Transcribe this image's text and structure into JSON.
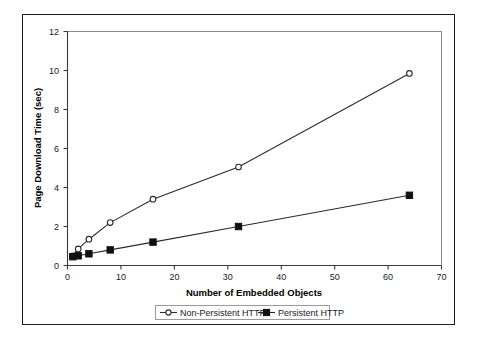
{
  "chart_data": {
    "type": "line",
    "title": "",
    "xlabel": "Number of Embedded Objects",
    "ylabel": "Page Download Time (sec)",
    "xlim": [
      0,
      70
    ],
    "ylim": [
      0,
      12
    ],
    "xticks": [
      0,
      10,
      20,
      30,
      40,
      50,
      60,
      70
    ],
    "yticks": [
      0,
      2,
      4,
      6,
      8,
      10,
      12
    ],
    "xtick_labels": [
      "0",
      "10",
      "20",
      "30",
      "40",
      "50",
      "60",
      "70"
    ],
    "ytick_labels": [
      "0",
      "2",
      "4",
      "6",
      "8",
      "10",
      "12"
    ],
    "grid": false,
    "legend_position": "bottom",
    "x": [
      1,
      2,
      4,
      8,
      16,
      32,
      64
    ],
    "series": [
      {
        "name": "Non-Persistent HTTP",
        "marker": "open-circle",
        "color": "#2b2b2b",
        "values": [
          0.5,
          0.85,
          1.35,
          2.2,
          3.4,
          5.05,
          9.85
        ]
      },
      {
        "name": "Persistent HTTP",
        "marker": "filled-square",
        "color": "#111111",
        "values": [
          0.45,
          0.5,
          0.6,
          0.8,
          1.2,
          2.0,
          3.6
        ]
      }
    ]
  },
  "legend": {
    "entries": [
      {
        "label": "Non-Persistent HTTP"
      },
      {
        "label": "Persistent HTTP"
      }
    ]
  },
  "axes": {
    "x_title": "Number of Embedded Objects",
    "y_title": "Page Download Time (sec)"
  }
}
